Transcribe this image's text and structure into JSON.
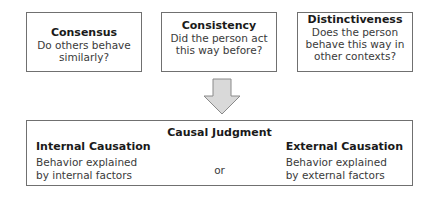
{
  "criteria": [
    {
      "title": "Consensus",
      "question": "Do others behave similarly?"
    },
    {
      "title": "Consistency",
      "question": "Did the person act this way before?"
    },
    {
      "title": "Distinctiveness",
      "question": "Does the person behave this way in other contexts?"
    }
  ],
  "arrow": {
    "direction": "down",
    "fill": "#d9d9d9",
    "stroke": "#8a8a8a"
  },
  "judgment": {
    "title": "Causal Judgment",
    "connector": "or",
    "internal": {
      "title": "Internal Causation",
      "description": "Behavior explained by internal factors"
    },
    "external": {
      "title": "External Causation",
      "description": "Behavior explained by external factors"
    }
  },
  "colors": {
    "border": "#707070",
    "text": "#2a2a2a"
  }
}
